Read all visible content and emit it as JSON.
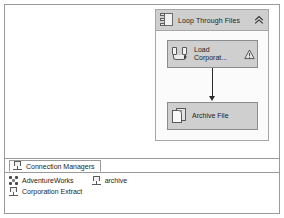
{
  "window": {
    "name": "ssis-control-flow-designer"
  },
  "design_surface": {
    "container": {
      "title": "Loop Through Files",
      "icon": "foreach-loop-container-icon",
      "collapse_icon": "chevron-double-up-icon",
      "tasks": [
        {
          "label": "Load\nCorporat...",
          "icon": "data-flow-task-icon",
          "badge": "warning-icon"
        },
        {
          "label": "Archive File",
          "icon": "file-system-task-icon",
          "badge": ""
        }
      ],
      "precedence_constraint": "on-success-arrow"
    }
  },
  "connection_panel": {
    "tab": {
      "label": "Connection Managers",
      "icon": "connection-icon"
    },
    "connections": [
      {
        "label": "AdventureWorks",
        "icon": "ole-db-connection-icon"
      },
      {
        "label": "archive",
        "icon": "file-connection-icon"
      },
      {
        "label": "Corporation Extract",
        "icon": "file-connection-icon"
      }
    ]
  },
  "colors": {
    "frame_border": "#9a9a9a",
    "header_fill": "#cfcfcf",
    "task_fill": "#cfcfcf",
    "task_border": "#8c8c8c",
    "surface": "#ffffff",
    "arrow": "#2b2b2b"
  }
}
